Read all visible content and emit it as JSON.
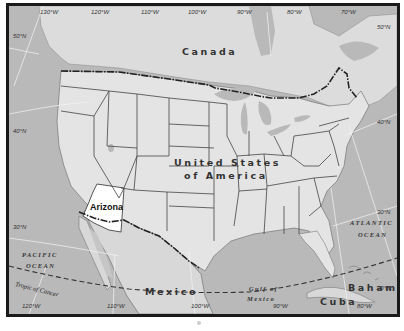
{
  "map": {
    "title": "North America map with Arizona highlighted",
    "highlighted_region": "Arizona",
    "colors": {
      "water": "#b9b9b9",
      "land": "#e4e4e4",
      "foreign_land": "#d8d8d8",
      "highlight": "#ffffff",
      "frame": "#1a1a1a"
    },
    "labels": {
      "countries": {
        "canada": "Canada",
        "usa_line1": "United States",
        "usa_line2": "of America",
        "mexico": "Mexico",
        "cuba": "Cuba",
        "bahamas": "Bahamas"
      },
      "state": "Arizona",
      "water": {
        "pacific_line1": "PACIFIC",
        "pacific_line2": "OCEAN",
        "atlantic_line1": "ATLANTIC",
        "atlantic_line2": "OCEAN",
        "gulf_line1": "Gulf of",
        "gulf_line2": "Mexico"
      },
      "tropic": "Tropic of Cancer"
    },
    "graticule": {
      "top_longitudes": [
        "130°W",
        "120°W",
        "110°W",
        "100°W",
        "90°W",
        "80°W",
        "70°W"
      ],
      "bottom_longitudes": [
        "120°W",
        "110°W",
        "100°W",
        "90°W",
        "80°W"
      ],
      "left_latitudes": [
        "50°N",
        "40°N",
        "30°N"
      ],
      "right_latitudes": [
        "50°N",
        "40°N",
        "30°N",
        "20°N"
      ]
    }
  }
}
